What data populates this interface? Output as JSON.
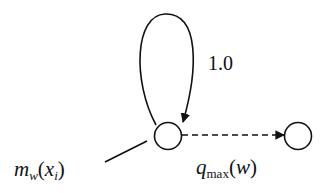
{
  "diagram": {
    "nodes": [
      {
        "id": "state",
        "label": ""
      },
      {
        "id": "next",
        "label": ""
      }
    ],
    "edges": [
      {
        "from": "state",
        "to": "state",
        "type": "self-loop",
        "style": "solid",
        "label": "1.0"
      },
      {
        "from": "state",
        "to": "next",
        "type": "arrow",
        "style": "dashed",
        "label": "q_max(w)"
      }
    ],
    "labels": {
      "loop_weight": "1.0",
      "node_label": {
        "main": "m",
        "sub": "w",
        "open": "(",
        "arg": "x",
        "arg_sub": "i",
        "close": ")"
      },
      "edge_label": {
        "main": "q",
        "sub": "max",
        "open": "(",
        "arg": "w",
        "close": ")"
      }
    },
    "colors": {
      "stroke": "#111111",
      "background": "#ffffff"
    }
  }
}
